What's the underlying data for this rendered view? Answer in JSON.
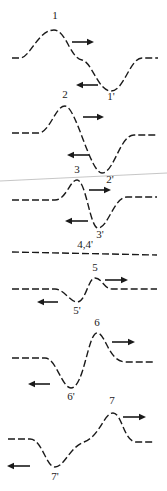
{
  "diagram": {
    "artifact_line": {
      "x1": 0,
      "y1": 181,
      "x2": 167,
      "y2": 173
    },
    "frames": [
      {
        "id": "1",
        "label_pos": "1",
        "label_neg": "1'",
        "label_pos_xy": [
          55,
          19
        ],
        "label_neg_xy": [
          111,
          100
        ],
        "path": "M12,58 L20,58 C30,58 38,30 54,30 C66,30 70,58 82,60 C92,62 98,91 111,91 C124,91 130,58 142,58 L158,58",
        "right_arrow": [
          72,
          94,
          42
        ],
        "left_arrow": [
          98,
          76,
          85
        ]
      },
      {
        "id": "2",
        "label_pos": "2",
        "label_neg": "2'",
        "label_pos_xy": [
          65,
          98
        ],
        "label_neg_xy": [
          110,
          183
        ],
        "path": "M12,133 L38,133 C50,133 55,106 65,106 C76,106 90,173 102,173 C114,173 120,135 134,135 L157,135",
        "right_arrow": [
          83,
          104,
          117
        ],
        "left_arrow": [
          89,
          67,
          155
        ]
      },
      {
        "id": "3",
        "label_pos": "3",
        "label_neg": "3'",
        "label_pos_xy": [
          77,
          173
        ],
        "label_neg_xy": [
          100,
          238
        ],
        "path": "M12,200 L55,200 C66,200 70,180 77,180 C86,180 90,228 98,228 C108,228 114,197 127,197 L157,197",
        "right_arrow": [
          89,
          111,
          190
        ],
        "left_arrow": [
          88,
          65,
          221
        ]
      },
      {
        "id": "4",
        "label": "4,4'",
        "label_xy": [
          85,
          248
        ],
        "path": "M12,252 L157,255"
      },
      {
        "id": "5",
        "label_pos": "5",
        "label_neg": "5'",
        "label_pos_xy": [
          95,
          271
        ],
        "label_neg_xy": [
          77,
          314
        ],
        "path": "M12,289 L55,289 C64,289 70,302 77,302 C86,302 88,278 95,278 C102,278 104,289 112,289 L157,289",
        "right_arrow": [
          105,
          128,
          280
        ],
        "left_arrow": [
          58,
          37,
          302
        ]
      },
      {
        "id": "6",
        "label_pos": "6",
        "label_neg": "6'",
        "label_pos_xy": [
          97,
          326
        ],
        "label_neg_xy": [
          71,
          400
        ],
        "path": "M12,358 L45,358 C56,358 62,388 71,388 C84,388 88,333 97,333 C106,333 108,362 126,362 L155,362",
        "right_arrow": [
          112,
          135,
          342
        ],
        "left_arrow": [
          50,
          28,
          384
        ]
      },
      {
        "id": "7",
        "label_pos": "7",
        "label_neg": "7'",
        "label_pos_xy": [
          112,
          404
        ],
        "label_neg_xy": [
          55,
          480
        ],
        "path": "M8,439 L30,439 C42,439 46,467 55,467 C64,467 70,447 84,442 C100,436 104,413 113,413 C122,413 124,442 136,442 L153,442",
        "right_arrow": [
          123,
          146,
          417
        ],
        "left_arrow": [
          30,
          7,
          466
        ]
      }
    ]
  }
}
